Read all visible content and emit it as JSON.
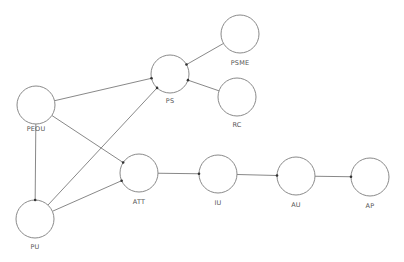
{
  "diagram": {
    "type": "path-model",
    "colors": {
      "node_stroke": "#8a8a8a",
      "edge_stroke": "#7a7a7a",
      "arrow_head": "#333333",
      "label_text": "#555555",
      "background": "#ffffff"
    },
    "nodes": [
      {
        "id": "PEOU",
        "label": "PEOU",
        "cx": 36,
        "cy": 105,
        "r": 19,
        "label_x": 36,
        "label_y": 126
      },
      {
        "id": "PU",
        "label": "PU",
        "cx": 35,
        "cy": 219,
        "r": 19,
        "label_x": 35,
        "label_y": 244
      },
      {
        "id": "PS",
        "label": "PS",
        "cx": 170,
        "cy": 74,
        "r": 19,
        "label_x": 170,
        "label_y": 98
      },
      {
        "id": "PSME",
        "label": "PSME",
        "cx": 240,
        "cy": 34,
        "r": 19,
        "label_x": 240,
        "label_y": 60
      },
      {
        "id": "RC",
        "label": "RC",
        "cx": 237,
        "cy": 97,
        "r": 19,
        "label_x": 237,
        "label_y": 122
      },
      {
        "id": "ATT",
        "label": "ATT",
        "cx": 139,
        "cy": 173,
        "r": 19,
        "label_x": 139,
        "label_y": 199
      },
      {
        "id": "IU",
        "label": "IU",
        "cx": 218,
        "cy": 174,
        "r": 19,
        "label_x": 218,
        "label_y": 200
      },
      {
        "id": "AU",
        "label": "AU",
        "cx": 296,
        "cy": 176,
        "r": 19,
        "label_x": 296,
        "label_y": 202
      },
      {
        "id": "AP",
        "label": "AP",
        "cx": 370,
        "cy": 177,
        "r": 19,
        "label_x": 370,
        "label_y": 203
      }
    ],
    "edges": [
      {
        "from": "PEOU",
        "to": "PS"
      },
      {
        "from": "PEOU",
        "to": "ATT"
      },
      {
        "from": "PEOU",
        "to": "PU"
      },
      {
        "from": "PU",
        "to": "PS"
      },
      {
        "from": "PU",
        "to": "ATT"
      },
      {
        "from": "PSME",
        "to": "PS"
      },
      {
        "from": "RC",
        "to": "PS"
      },
      {
        "from": "ATT",
        "to": "IU"
      },
      {
        "from": "IU",
        "to": "AU"
      },
      {
        "from": "AU",
        "to": "AP"
      }
    ]
  }
}
